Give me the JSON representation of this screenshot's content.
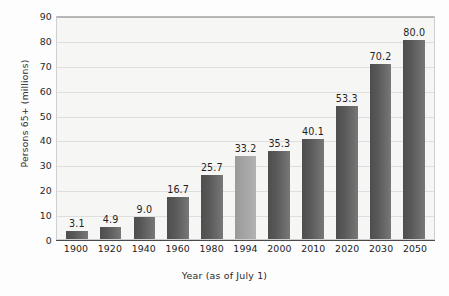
{
  "chart_data": {
    "type": "bar",
    "title": "",
    "subtitle": "",
    "xlabel": "Year (as of July 1)",
    "ylabel": "Persons 65+ (millions)",
    "categories": [
      "1900",
      "1920",
      "1940",
      "1960",
      "1980",
      "1994",
      "2000",
      "2010",
      "2020",
      "2030",
      "2050"
    ],
    "values": [
      3.1,
      4.9,
      9.0,
      16.7,
      25.7,
      33.2,
      35.3,
      40.1,
      53.3,
      70.2,
      80.0
    ],
    "value_labels": [
      "3.1",
      "4.9",
      "9.0",
      "16.7",
      "25.7",
      "33.2",
      "35.3",
      "40.1",
      "53.3",
      "70.2",
      "80.0"
    ],
    "ylim": [
      0,
      90
    ],
    "yticks": [
      0,
      10,
      20,
      30,
      40,
      50,
      60,
      70,
      80,
      90
    ],
    "ytick_labels": [
      "0",
      "10",
      "20",
      "30",
      "40",
      "50",
      "60",
      "70",
      "80",
      "90"
    ],
    "grid": "horizontal",
    "legend": "none",
    "bar_colors": [
      "#585858",
      "#585858",
      "#585858",
      "#585858",
      "#585858",
      "#a3a3a3",
      "#585858",
      "#585858",
      "#585858",
      "#585858",
      "#585858"
    ],
    "highlight_category": "1994",
    "plot_background": "#f6f6f4",
    "gridline_color": "#dedede",
    "axis_color": "#4a4a4a",
    "text_color": "#212121"
  }
}
